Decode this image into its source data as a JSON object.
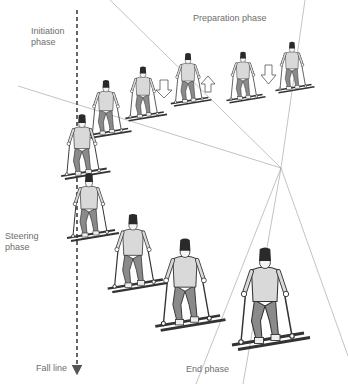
{
  "diagram": {
    "labels": {
      "initiation": "Initiation\nphase",
      "preparation": "Preparation phase",
      "steering": "Steering\nphase",
      "end": "End phase",
      "fall_line": "Fall line"
    },
    "colors": {
      "background": "#ffffff",
      "text": "#6e6e6e",
      "guide_lines": "#9a9a9a",
      "fall_line": "#555555",
      "sweater": "#d9d9d9",
      "trousers": "#8a8a8a",
      "hat": "#2a2a2a",
      "outline": "#333333"
    },
    "guide_lines_origin": [
      281,
      168
    ],
    "arrows": [
      {
        "direction": "down",
        "name": "weight-down-arrow-1"
      },
      {
        "direction": "up",
        "name": "weight-up-arrow"
      },
      {
        "direction": "down",
        "name": "weight-down-arrow-2"
      }
    ],
    "skier_count": 10
  }
}
